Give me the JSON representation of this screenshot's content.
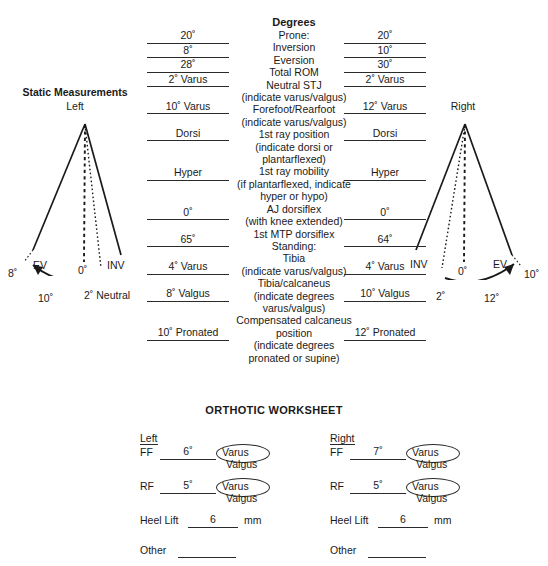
{
  "diagrams": {
    "title": "Static Measurements",
    "left": {
      "side_label": "Left",
      "ev_label": "EV",
      "inv_label": "INV",
      "zero_label": "0˚",
      "outer_angle": "8˚",
      "arc_value": "10˚",
      "neutral_label": "2˚ Neutral"
    },
    "right": {
      "side_label": "Right",
      "inv_label": "INV",
      "ev_label": "EV",
      "zero_label": "0˚",
      "outer_angle": "10˚",
      "arc_value": "12˚",
      "neutral_label": "2˚"
    }
  },
  "table": {
    "heading": "Degrees",
    "sections": [
      {
        "name": "Prone:",
        "rows": [
          {
            "label": "Inversion",
            "note": "",
            "left": "20˚",
            "right": "20˚"
          },
          {
            "label": "Eversion",
            "note": "",
            "left": "8˚",
            "right": "10˚"
          },
          {
            "label": "Total ROM",
            "note": "",
            "left": "28˚",
            "right": "30˚"
          },
          {
            "label": "Neutral STJ",
            "note": "(indicate varus/valgus)",
            "left": "2˚ Varus",
            "right": "2˚ Varus"
          },
          {
            "label": "Forefoot/Rearfoot",
            "note": "(indicate varus/valgus)",
            "left": "10˚ Varus",
            "right": "12˚ Varus"
          },
          {
            "label": "1st ray position",
            "note": "(indicate dorsi or\nplantarflexed)",
            "left": "Dorsi",
            "right": "Dorsi"
          },
          {
            "label": "1st ray mobility",
            "note": "(if plantarflexed, indicate\nhyper or  hypo)",
            "left": "Hyper",
            "right": "Hyper"
          },
          {
            "label": "AJ dorsiflex",
            "note": "(with knee extended)",
            "left": "0˚",
            "right": "0˚"
          },
          {
            "label": "1st MTP dorsiflex",
            "note": "",
            "left": "65˚",
            "right": "64˚"
          }
        ]
      },
      {
        "name": "Standing:",
        "rows": [
          {
            "label": "Tibia",
            "note": "(indicate varus/valgus)",
            "left": "4˚ Varus",
            "right": "4˚ Varus"
          },
          {
            "label": "Tibia/calcaneus",
            "note": "(indicate degrees\nvarus/valgus)",
            "left": "8˚ Valgus",
            "right": "10˚ Valgus"
          },
          {
            "label": "Compensated calcaneus\nposition",
            "note": "(indicate degrees\npronated or supine)",
            "left": "10˚ Pronated",
            "right": "12˚ Pronated"
          }
        ]
      }
    ]
  },
  "worksheet": {
    "title": "ORTHOTIC WORKSHEET",
    "sides": [
      {
        "header": "Left",
        "ff_label": "FF",
        "ff_value": "6˚",
        "ff_opt1": "Varus",
        "ff_opt2": "Valgus",
        "rf_label": "RF",
        "rf_value": "5˚",
        "rf_opt1": "Varus",
        "rf_opt2": "Valgus",
        "heel_label": "Heel Lift",
        "heel_value": "6",
        "heel_unit": "mm",
        "other_label": "Other",
        "other_value": ""
      },
      {
        "header": "Right",
        "ff_label": "FF",
        "ff_value": "7˚",
        "ff_opt1": "Varus",
        "ff_opt2": "Valgus",
        "rf_label": "RF",
        "rf_value": "5˚",
        "rf_opt1": "Varus",
        "rf_opt2": "Valgus",
        "heel_label": "Heel Lift",
        "heel_value": "6",
        "heel_unit": "mm",
        "other_label": "Other",
        "other_value": ""
      }
    ]
  },
  "colors": {
    "ink": "#1a1a1a",
    "rule": "#2a2a2a"
  }
}
